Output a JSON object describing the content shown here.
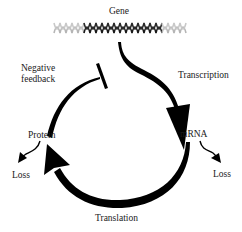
{
  "diagram": {
    "type": "gene-regulation-feedback-loop",
    "nodes": {
      "gene": "Gene",
      "mrna": "mRNA",
      "protein": "Protein"
    },
    "edges": {
      "transcription": "Transcription",
      "translation": "Translation",
      "negative_feedback_line1": "Negative",
      "negative_feedback_line2": "feedback",
      "mrna_loss": "Loss",
      "protein_loss": "Loss"
    },
    "colors": {
      "arrow": "#000000",
      "helix_dark": "#1a1a1a",
      "helix_light": "#b0b0b0",
      "text": "#1a1a1a",
      "background": "#ffffff"
    }
  }
}
